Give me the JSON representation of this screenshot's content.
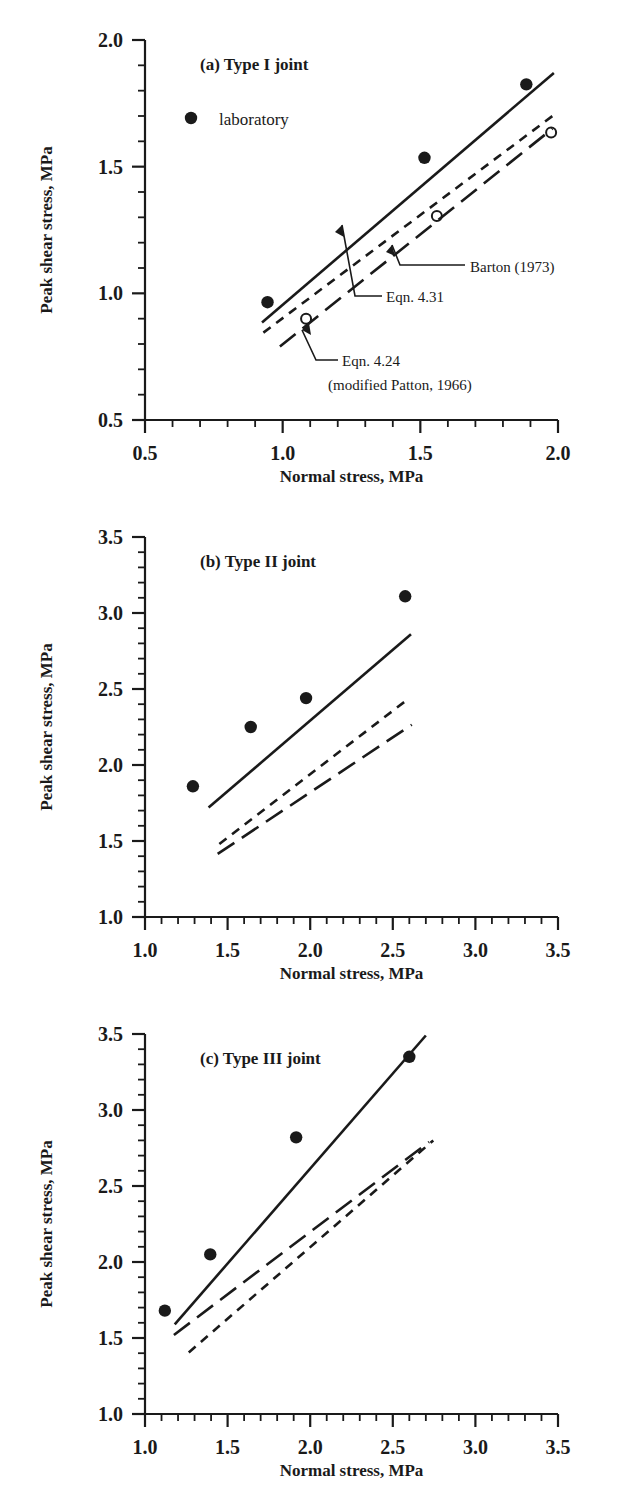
{
  "figure": {
    "axis_titles": {
      "x": "Normal stress, MPa",
      "y": "Peak shear stress, MPa"
    },
    "legend": {
      "marker_label": "laboratory"
    },
    "annotations": {
      "barton": "Barton (1973)",
      "eqn431": "Eqn. 4.31",
      "eqn424": "Eqn. 4.24",
      "eqn424_sub": "(modified Patton, 1966)"
    },
    "colors": {
      "ink": "#1a1a1a",
      "background": "#ffffff"
    }
  },
  "chart_data": [
    {
      "type": "scatter",
      "panel": "a",
      "title": "(a) Type I joint",
      "xlabel": "Normal stress, MPa",
      "ylabel": "Peak shear stress, MPa",
      "xlim": [
        0.5,
        2.0
      ],
      "ylim": [
        0.5,
        2.0
      ],
      "xticks": [
        0.5,
        1.0,
        1.5,
        2.0
      ],
      "xtick_labels": [
        "0.5",
        "1.0",
        "1.5",
        "2.0"
      ],
      "yticks": [
        0.5,
        1.0,
        1.5,
        2.0
      ],
      "ytick_labels": [
        "0.5",
        "1.0",
        "1.5",
        "2.0"
      ],
      "minor_ticks_per_interval": 4,
      "grid": false,
      "legend_position": "upper-left-inside",
      "series": [
        {
          "name": "laboratory",
          "style": "filled-circle",
          "points": [
            {
              "x": 0.945,
              "y": 0.965
            },
            {
              "x": 1.515,
              "y": 1.535
            },
            {
              "x": 1.885,
              "y": 1.825
            }
          ]
        },
        {
          "name": "open-circle-data",
          "style": "open-circle",
          "points": [
            {
              "x": 1.085,
              "y": 0.9
            },
            {
              "x": 1.56,
              "y": 1.305
            },
            {
              "x": 1.975,
              "y": 1.635
            }
          ]
        },
        {
          "name": "Eqn. 4.31",
          "style": "solid",
          "line": [
            {
              "x": 0.925,
              "y": 0.885
            },
            {
              "x": 1.985,
              "y": 1.87
            }
          ]
        },
        {
          "name": "Barton (1973)",
          "style": "dashed",
          "line": [
            {
              "x": 0.93,
              "y": 0.845
            },
            {
              "x": 1.98,
              "y": 1.7
            }
          ]
        },
        {
          "name": "Eqn. 4.24 (modified Patton, 1966)",
          "style": "dash-dot",
          "line": [
            {
              "x": 0.99,
              "y": 0.79
            },
            {
              "x": 1.98,
              "y": 1.65
            }
          ]
        }
      ]
    },
    {
      "type": "scatter",
      "panel": "b",
      "title": "(b) Type II joint",
      "xlabel": "Normal stress, MPa",
      "ylabel": "Peak shear stress, MPa",
      "xlim": [
        1.0,
        3.5
      ],
      "ylim": [
        1.0,
        3.5
      ],
      "xticks": [
        1.0,
        1.5,
        2.0,
        2.5,
        3.0,
        3.5
      ],
      "xtick_labels": [
        "1.0",
        "1.5",
        "2.0",
        "2.5",
        "3.0",
        "3.5"
      ],
      "yticks": [
        1.0,
        1.5,
        2.0,
        2.5,
        3.0,
        3.5
      ],
      "ytick_labels": [
        "1.0",
        "1.5",
        "2.0",
        "2.5",
        "3.0",
        "3.5"
      ],
      "minor_ticks_per_interval": 4,
      "grid": false,
      "legend_position": "none",
      "series": [
        {
          "name": "laboratory",
          "style": "filled-circle",
          "points": [
            {
              "x": 1.29,
              "y": 1.86
            },
            {
              "x": 1.64,
              "y": 2.25
            },
            {
              "x": 1.975,
              "y": 2.44
            },
            {
              "x": 2.575,
              "y": 3.11
            }
          ]
        },
        {
          "name": "Eqn. 4.31",
          "style": "solid",
          "line": [
            {
              "x": 1.385,
              "y": 1.72
            },
            {
              "x": 2.61,
              "y": 2.86
            }
          ]
        },
        {
          "name": "Barton (1973)",
          "style": "dashed",
          "line": [
            {
              "x": 1.45,
              "y": 1.48
            },
            {
              "x": 2.6,
              "y": 2.44
            }
          ]
        },
        {
          "name": "Eqn. 4.24 (modified Patton, 1966)",
          "style": "dash-dot",
          "line": [
            {
              "x": 1.44,
              "y": 1.415
            },
            {
              "x": 2.615,
              "y": 2.265
            }
          ]
        }
      ]
    },
    {
      "type": "scatter",
      "panel": "c",
      "title": "(c) Type III joint",
      "xlabel": "Normal stress, MPa",
      "ylabel": "Peak shear stress, MPa",
      "xlim": [
        1.0,
        3.5
      ],
      "ylim": [
        1.0,
        3.5
      ],
      "xticks": [
        1.0,
        1.5,
        2.0,
        2.5,
        3.0,
        3.5
      ],
      "xtick_labels": [
        "1.0",
        "1.5",
        "2.0",
        "2.5",
        "3.0",
        "3.5"
      ],
      "yticks": [
        1.0,
        1.5,
        2.0,
        2.5,
        3.0,
        3.5
      ],
      "ytick_labels": [
        "1.0",
        "1.5",
        "2.0",
        "2.5",
        "3.0",
        "3.5"
      ],
      "minor_ticks_per_interval": 4,
      "grid": false,
      "legend_position": "none",
      "series": [
        {
          "name": "laboratory",
          "style": "filled-circle",
          "points": [
            {
              "x": 1.12,
              "y": 1.68
            },
            {
              "x": 1.395,
              "y": 2.05
            },
            {
              "x": 1.915,
              "y": 2.82
            },
            {
              "x": 2.6,
              "y": 3.35
            }
          ]
        },
        {
          "name": "Eqn. 4.31",
          "style": "solid",
          "line": [
            {
              "x": 1.18,
              "y": 1.59
            },
            {
              "x": 2.7,
              "y": 3.49
            }
          ]
        },
        {
          "name": "Barton (1973)",
          "style": "dashed",
          "line": [
            {
              "x": 1.265,
              "y": 1.405
            },
            {
              "x": 2.745,
              "y": 2.8
            }
          ]
        },
        {
          "name": "Eqn. 4.24 (modified Patton, 1966)",
          "style": "dash-dot",
          "line": [
            {
              "x": 1.175,
              "y": 1.52
            },
            {
              "x": 2.72,
              "y": 2.79
            }
          ]
        }
      ]
    }
  ]
}
